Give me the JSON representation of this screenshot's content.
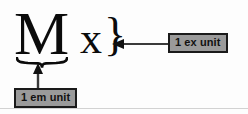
{
  "figure": {
    "background_color": "#fdfdfd",
    "ink_color": "#0b0b0b",
    "callout_fill": "#9a9a9a",
    "callout_border": "#1a1a1a"
  },
  "specimens": {
    "em_glyph": "M",
    "ex_glyph": "x",
    "ex_brace": "}"
  },
  "callouts": {
    "em_label": "1 em unit",
    "ex_label": "1 ex unit"
  },
  "annotations": {
    "underbrace_name": "horizontal-underbrace",
    "arrow_em_direction": "up",
    "arrow_ex_direction": "left"
  }
}
